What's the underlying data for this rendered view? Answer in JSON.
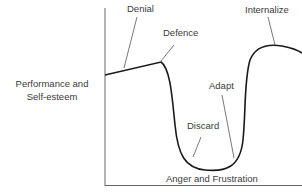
{
  "diagram": {
    "title": "",
    "y_axis_label_line1": "Performance and",
    "y_axis_label_line2": "Self-esteem",
    "stages": [
      {
        "label": "Denial"
      },
      {
        "label": "Defence"
      },
      {
        "label": "Discard"
      },
      {
        "label": "Anger and Frustration"
      },
      {
        "label": "Adapt"
      },
      {
        "label": "Internalize"
      }
    ],
    "colors": {
      "curve": "#1a1a1a",
      "axis": "#555555",
      "leader": "#555555",
      "text": "#3a3a3a"
    }
  }
}
